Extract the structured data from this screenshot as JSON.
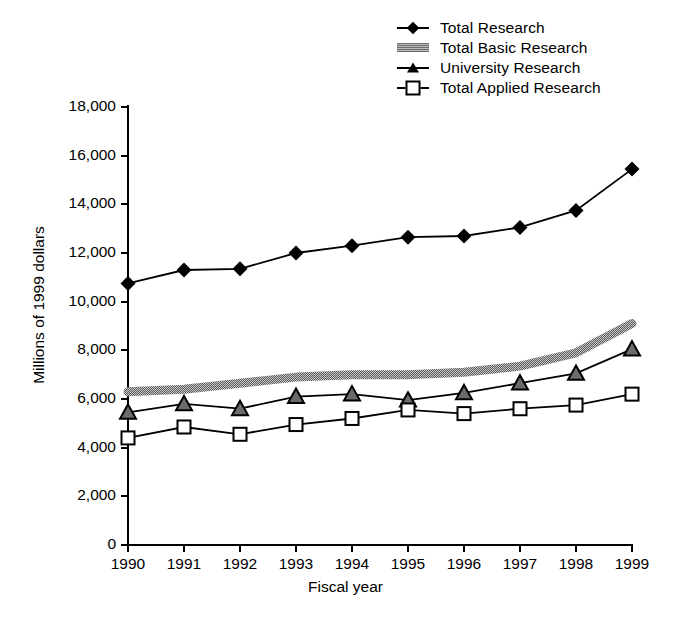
{
  "chart_data": {
    "type": "line",
    "title": "",
    "xlabel": "Fiscal year",
    "ylabel": "Millions of 1999 dollars",
    "x": [
      1990,
      1991,
      1992,
      1993,
      1994,
      1995,
      1996,
      1997,
      1998,
      1999
    ],
    "categories": [
      "1990",
      "1991",
      "1992",
      "1993",
      "1994",
      "1995",
      "1996",
      "1997",
      "1998",
      "1999"
    ],
    "xlim": [
      1990,
      1999
    ],
    "ylim": [
      0,
      18000
    ],
    "yticks": [
      0,
      2000,
      4000,
      6000,
      8000,
      10000,
      12000,
      14000,
      16000,
      18000
    ],
    "ytick_labels": [
      "0",
      "2,000",
      "4,000",
      "6,000",
      "8,000",
      "10,000",
      "12,000",
      "14,000",
      "16,000",
      "18,000"
    ],
    "grid": false,
    "legend_position": "top-right",
    "series": [
      {
        "name": "Total Research",
        "marker": "filled-diamond",
        "color": "#000000",
        "values": [
          10750,
          11300,
          11350,
          12000,
          12300,
          12650,
          12700,
          13050,
          13750,
          15450
        ]
      },
      {
        "name": "Total Basic Research",
        "marker": "gray-band",
        "color": "#808080",
        "values": [
          6300,
          6400,
          6650,
          6900,
          7000,
          7000,
          7100,
          7350,
          7900,
          9100
        ]
      },
      {
        "name": "University Research",
        "marker": "filled-triangle",
        "color": "#000000",
        "values": [
          5450,
          5800,
          5600,
          6100,
          6200,
          5950,
          6250,
          6650,
          7050,
          8050
        ]
      },
      {
        "name": "Total Applied Research",
        "marker": "open-square",
        "color": "#000000",
        "values": [
          4400,
          4850,
          4550,
          4950,
          5200,
          5550,
          5400,
          5600,
          5750,
          6200
        ]
      }
    ]
  },
  "legend": {
    "items": [
      {
        "label": "Total Research",
        "marker": "filled-diamond"
      },
      {
        "label": "Total Basic Research",
        "marker": "gray-band"
      },
      {
        "label": "University Research",
        "marker": "filled-triangle"
      },
      {
        "label": "Total Applied Research",
        "marker": "open-square"
      }
    ]
  }
}
